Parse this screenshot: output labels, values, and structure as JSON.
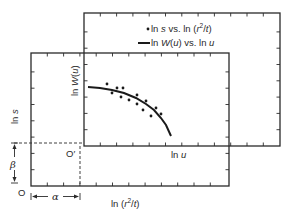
{
  "colors": {
    "ink": "#2a2a2a",
    "background": "#ffffff"
  },
  "upper_plot": {
    "rect": {
      "x": 84,
      "y": 13,
      "w": 196,
      "h": 133
    },
    "x_axis_label": {
      "pre": "ln ",
      "var": "u"
    },
    "y_axis_label": {
      "pre": "ln ",
      "var": "W",
      "mid": "(",
      "var2": "u",
      "post": ")"
    },
    "origin_label": "O′"
  },
  "lower_plot": {
    "rect": {
      "x": 31,
      "y": 53,
      "w": 198,
      "h": 133
    },
    "x_axis_label": {
      "pre": "ln (",
      "var": "r",
      "sup": "2",
      "post": "/",
      "var2": "t",
      "end": ")"
    },
    "y_axis_label": {
      "pre": "ln ",
      "var": "s"
    },
    "origin_label": "O"
  },
  "legend": {
    "items": [
      {
        "marker": "dot",
        "pre": "ln ",
        "var": "s",
        "mid": " vs. ln (",
        "var2": "r",
        "sup": "2",
        "post": "/",
        "var3": "t",
        "end": ")"
      },
      {
        "marker": "line",
        "pre": "ln ",
        "var": "W",
        "mid": "(",
        "var2": "u",
        "post": ") vs. ln ",
        "var3": "u"
      }
    ]
  },
  "offsets": {
    "alpha": "α",
    "beta": "β"
  },
  "data_points": [
    [
      107,
      84
    ],
    [
      112,
      93
    ],
    [
      117,
      88
    ],
    [
      123,
      88
    ],
    [
      121,
      97
    ],
    [
      129,
      100
    ],
    [
      137,
      95
    ],
    [
      137,
      104
    ],
    [
      143,
      110
    ],
    [
      146,
      101
    ],
    [
      151,
      116
    ],
    [
      156,
      108
    ],
    [
      161,
      114
    ]
  ],
  "type_curve": [
    [
      88,
      87
    ],
    [
      100,
      88
    ],
    [
      112,
      90
    ],
    [
      124,
      93
    ],
    [
      136,
      98
    ],
    [
      146,
      104
    ],
    [
      154,
      110
    ],
    [
      161,
      118
    ],
    [
      166,
      125
    ],
    [
      171,
      136
    ]
  ]
}
